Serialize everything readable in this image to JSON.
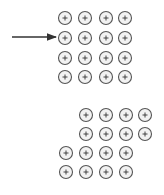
{
  "diagram": {
    "colors": {
      "stroke": "#555555",
      "fill": "#f2f2f2",
      "arrow": "#333333"
    },
    "ion_symbol": "+",
    "ion_radius": 6.5,
    "arrow": {
      "x1": 12,
      "y1": 37,
      "x2": 56,
      "y2": 37
    },
    "top_lattice": {
      "cols_x": [
        65,
        85,
        106,
        125
      ],
      "rows_y": [
        18,
        38,
        58,
        77
      ]
    },
    "bottom_lattice": {
      "rows": [
        {
          "y": 115,
          "cols_x": [
            86,
            106,
            126,
            145
          ]
        },
        {
          "y": 134,
          "cols_x": [
            86,
            106,
            126,
            145
          ]
        },
        {
          "y": 153,
          "cols_x": [
            66,
            86,
            106,
            126
          ]
        },
        {
          "y": 172,
          "cols_x": [
            66,
            86,
            106,
            126
          ]
        }
      ]
    }
  }
}
